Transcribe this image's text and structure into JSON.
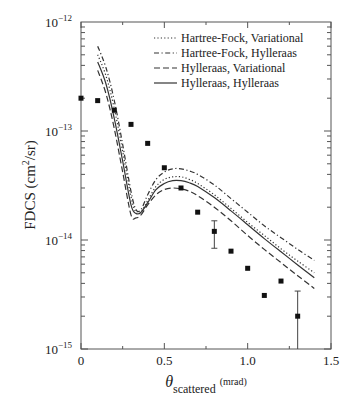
{
  "chart_data": {
    "type": "line",
    "title": "",
    "xlabel": "θ",
    "xlabel_sub": "scattered",
    "xlabel_unit": "(mrad)",
    "ylabel": "FDCS (cm²/sr)",
    "ylabel_parts": {
      "main": "FDCS (cm",
      "sup": "2",
      "tail": "/sr)"
    },
    "xlim": [
      0,
      1.5
    ],
    "ylim": [
      1e-15,
      1e-12
    ],
    "yscale": "log",
    "x_ticks": [
      0,
      0.5,
      1.0,
      1.5
    ],
    "x_tick_labels": [
      "0",
      "0.5",
      "1.0",
      "1.5"
    ],
    "y_ticks": [
      1e-12,
      1e-13,
      1e-14,
      1e-15
    ],
    "y_tick_labels": [
      {
        "base": "10",
        "exp": "−12"
      },
      {
        "base": "10",
        "exp": "−13"
      },
      {
        "base": "10",
        "exp": "−14"
      },
      {
        "base": "10",
        "exp": "−15"
      }
    ],
    "grid": false,
    "legend_position": "upper right",
    "series": [
      {
        "name": "Hartree-Fock, Variational",
        "style": "dotted",
        "x": [
          0.1,
          0.15,
          0.2,
          0.25,
          0.3,
          0.33,
          0.36,
          0.4,
          0.45,
          0.5,
          0.55,
          0.6,
          0.65,
          0.7,
          0.8,
          0.9,
          1.0,
          1.1,
          1.2,
          1.3,
          1.4
        ],
        "y": [
          5e-13,
          3.2e-13,
          1.6e-13,
          6.5e-14,
          2.5e-14,
          1.8e-14,
          1.8e-14,
          2.3e-14,
          3.1e-14,
          3.6e-14,
          3.8e-14,
          3.8e-14,
          3.6e-14,
          3.3e-14,
          2.6e-14,
          1.95e-14,
          1.45e-14,
          1.1e-14,
          8.3e-15,
          6.4e-15,
          5e-15
        ]
      },
      {
        "name": "Hartree-Fock, Hylleraas",
        "style": "dash-dot",
        "x": [
          0.1,
          0.15,
          0.2,
          0.25,
          0.3,
          0.33,
          0.36,
          0.4,
          0.45,
          0.5,
          0.55,
          0.6,
          0.65,
          0.7,
          0.8,
          0.9,
          1.0,
          1.1,
          1.2,
          1.3,
          1.4
        ],
        "y": [
          6e-13,
          3.8e-13,
          1.9e-13,
          7.5e-14,
          2.8e-14,
          1.9e-14,
          1.9e-14,
          2.6e-14,
          3.6e-14,
          4.2e-14,
          4.5e-14,
          4.5e-14,
          4.3e-14,
          4e-14,
          3.2e-14,
          2.4e-14,
          1.8e-14,
          1.35e-14,
          1.05e-14,
          8.2e-15,
          6.5e-15
        ]
      },
      {
        "name": "Hylleraas, Variational",
        "style": "dashed",
        "x": [
          0.1,
          0.15,
          0.2,
          0.25,
          0.3,
          0.33,
          0.36,
          0.4,
          0.45,
          0.5,
          0.55,
          0.6,
          0.65,
          0.7,
          0.8,
          0.9,
          1.0,
          1.1,
          1.2,
          1.3,
          1.4
        ],
        "y": [
          3.6e-13,
          2.2e-13,
          1.05e-13,
          4.2e-14,
          1.7e-14,
          1.6e-14,
          1.7e-14,
          2.1e-14,
          2.6e-14,
          2.9e-14,
          3e-14,
          2.95e-14,
          2.8e-14,
          2.55e-14,
          2e-14,
          1.5e-14,
          1.1e-14,
          8.2e-15,
          6.2e-15,
          4.7e-15,
          3.6e-15
        ]
      },
      {
        "name": "Hylleraas, Hylleraas",
        "style": "solid",
        "x": [
          0.1,
          0.15,
          0.2,
          0.25,
          0.3,
          0.33,
          0.36,
          0.4,
          0.45,
          0.5,
          0.55,
          0.6,
          0.65,
          0.7,
          0.8,
          0.9,
          1.0,
          1.1,
          1.2,
          1.3,
          1.4
        ],
        "y": [
          4.3e-13,
          2.7e-13,
          1.3e-13,
          5.3e-14,
          2.1e-14,
          1.75e-14,
          1.8e-14,
          2.2e-14,
          2.9e-14,
          3.3e-14,
          3.5e-14,
          3.5e-14,
          3.35e-14,
          3.1e-14,
          2.45e-14,
          1.85e-14,
          1.38e-14,
          1.03e-14,
          7.8e-15,
          5.9e-15,
          4.5e-15
        ]
      }
    ],
    "experimental": {
      "name": "Experiment",
      "marker": "square",
      "x": [
        0.0,
        0.1,
        0.2,
        0.3,
        0.4,
        0.5,
        0.6,
        0.7,
        0.8,
        0.9,
        1.0,
        1.1,
        1.2,
        1.3
      ],
      "y": [
        2e-13,
        1.9e-13,
        1.55e-13,
        1.15e-13,
        7.7e-14,
        4.6e-14,
        3e-14,
        1.8e-14,
        1.2e-14,
        7.9e-15,
        5.5e-15,
        3.1e-15,
        4.2e-15,
        2e-15
      ],
      "error_bars": [
        {
          "x": 0.8,
          "low": 8.4e-15,
          "high": 1.5e-14
        },
        {
          "x": 1.3,
          "low": 1e-15,
          "high": 3.4e-15
        }
      ]
    }
  }
}
